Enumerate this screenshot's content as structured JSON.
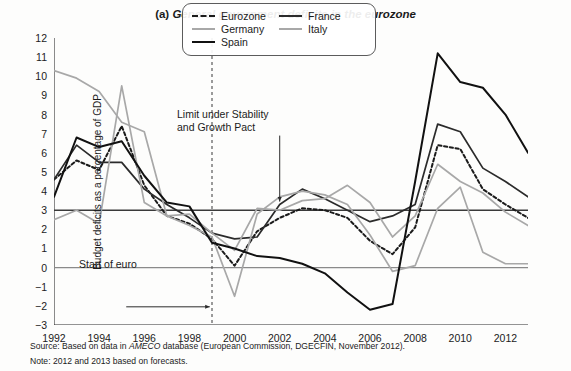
{
  "title": {
    "label": "(a)",
    "text": "General government deficits in the eurozone"
  },
  "source": {
    "prefix": "Source: Based on data in ",
    "italic": "AMECO",
    "suffix": " database (European Commission, DGECFIN, November 2012)."
  },
  "note": {
    "text": "Note: 2012 and 2013 based on forecasts."
  },
  "annotations": {
    "limit": "Limit under Stability\nand Growth Pact",
    "euro": "Start of euro"
  },
  "legend": {
    "entries": [
      {
        "name": "Eurozone",
        "style": "dashed",
        "color": "#1b1b1b"
      },
      {
        "name": "France",
        "style": "solid",
        "color": "#2b2b2b"
      },
      {
        "name": "Germany",
        "style": "solid",
        "color": "#a8a8a8"
      },
      {
        "name": "Italy",
        "style": "solid",
        "color": "#a8a8a8"
      },
      {
        "name": "Spain",
        "style": "solid",
        "color": "#111111"
      }
    ]
  },
  "chart_data": {
    "type": "line",
    "title": "(a) General government deficits in the eurozone",
    "xlabel": "",
    "ylabel": "Budget deficits as a percentage of GDP",
    "xlim": [
      1992,
      2013
    ],
    "ylim": [
      -3,
      12
    ],
    "yticks": [
      12,
      11,
      10,
      9,
      8,
      7,
      6,
      5,
      4,
      3,
      2,
      1,
      0,
      -1,
      -2,
      -3
    ],
    "xticks": [
      1992,
      1994,
      1996,
      1998,
      2000,
      2002,
      2004,
      2006,
      2008,
      2010,
      2012
    ],
    "xtick_minor": [
      1993,
      1995,
      1997,
      1999,
      2001,
      2003,
      2005,
      2007,
      2009,
      2011,
      2013
    ],
    "grid": false,
    "legend_position": "top-center",
    "reference_lines": [
      {
        "value": 3,
        "label": "Limit under Stability and Growth Pact",
        "color": "#3a3a3a"
      },
      {
        "value": 0,
        "label": "",
        "color": "#8a8a8a"
      }
    ],
    "vertical_lines": [
      {
        "value": 1999,
        "label": "Start of euro",
        "style": "dashed",
        "color": "#4a4a4a"
      }
    ],
    "x": [
      1992,
      1993,
      1994,
      1995,
      1996,
      1997,
      1998,
      1999,
      2000,
      2001,
      2002,
      2003,
      2004,
      2005,
      2006,
      2007,
      2008,
      2009,
      2010,
      2011,
      2012,
      2013
    ],
    "series": [
      {
        "name": "Eurozone",
        "style": "dashed",
        "color": "#1b1b1b",
        "width": 2.0,
        "values": [
          4.6,
          5.6,
          5.1,
          7.4,
          4.3,
          2.7,
          2.3,
          1.5,
          0.1,
          1.9,
          2.6,
          3.1,
          3.0,
          2.6,
          1.4,
          0.7,
          2.1,
          6.4,
          6.2,
          4.1,
          3.3,
          2.6
        ]
      },
      {
        "name": "France",
        "style": "solid",
        "color": "#2b2b2b",
        "width": 1.7,
        "values": [
          4.6,
          6.4,
          5.5,
          5.5,
          4.1,
          3.3,
          2.6,
          1.8,
          1.5,
          1.6,
          3.3,
          4.1,
          3.6,
          3.0,
          2.4,
          2.7,
          3.3,
          7.5,
          7.1,
          5.2,
          4.5,
          3.7
        ]
      },
      {
        "name": "Germany",
        "style": "solid",
        "color": "#a8a8a8",
        "width": 1.7,
        "values": [
          2.5,
          3.0,
          2.3,
          9.5,
          3.4,
          2.7,
          2.2,
          1.6,
          -1.5,
          2.8,
          3.7,
          4.0,
          3.8,
          3.3,
          1.7,
          -0.2,
          0.1,
          3.1,
          4.2,
          0.8,
          0.2,
          0.2
        ]
      },
      {
        "name": "Italy",
        "style": "solid",
        "color": "#a8a8a8",
        "width": 1.7,
        "values": [
          10.3,
          9.9,
          9.2,
          7.6,
          7.1,
          2.7,
          2.8,
          1.8,
          0.9,
          3.1,
          3.0,
          3.5,
          3.6,
          4.3,
          3.4,
          1.6,
          2.7,
          5.4,
          4.5,
          3.9,
          2.9,
          2.2
        ]
      },
      {
        "name": "Spain",
        "style": "solid",
        "color": "#111111",
        "width": 2.0,
        "values": [
          3.7,
          6.8,
          6.3,
          6.6,
          4.8,
          3.4,
          3.2,
          1.3,
          1.0,
          0.6,
          0.5,
          0.2,
          -0.3,
          -1.3,
          -2.2,
          -1.9,
          4.5,
          11.2,
          9.7,
          9.4,
          8.0,
          6.0
        ]
      }
    ]
  }
}
